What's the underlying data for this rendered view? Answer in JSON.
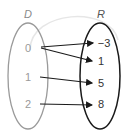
{
  "diagram": {
    "type": "mapping",
    "domain": {
      "label": "D",
      "color": "#9a9a9a",
      "elements": [
        {
          "id": "d0",
          "value": "0"
        },
        {
          "id": "d1",
          "value": "1"
        },
        {
          "id": "d2",
          "value": "2"
        }
      ]
    },
    "range": {
      "label": "R",
      "color": "#1a1a1a",
      "elements": [
        {
          "id": "r0",
          "value": "−3"
        },
        {
          "id": "r1",
          "value": "1"
        },
        {
          "id": "r2",
          "value": "5"
        },
        {
          "id": "r3",
          "value": "8"
        }
      ]
    },
    "mappings": [
      {
        "from": "0",
        "to": "−3"
      },
      {
        "from": "0",
        "to": "1"
      },
      {
        "from": "1",
        "to": "5"
      },
      {
        "from": "2",
        "to": "8"
      }
    ]
  }
}
